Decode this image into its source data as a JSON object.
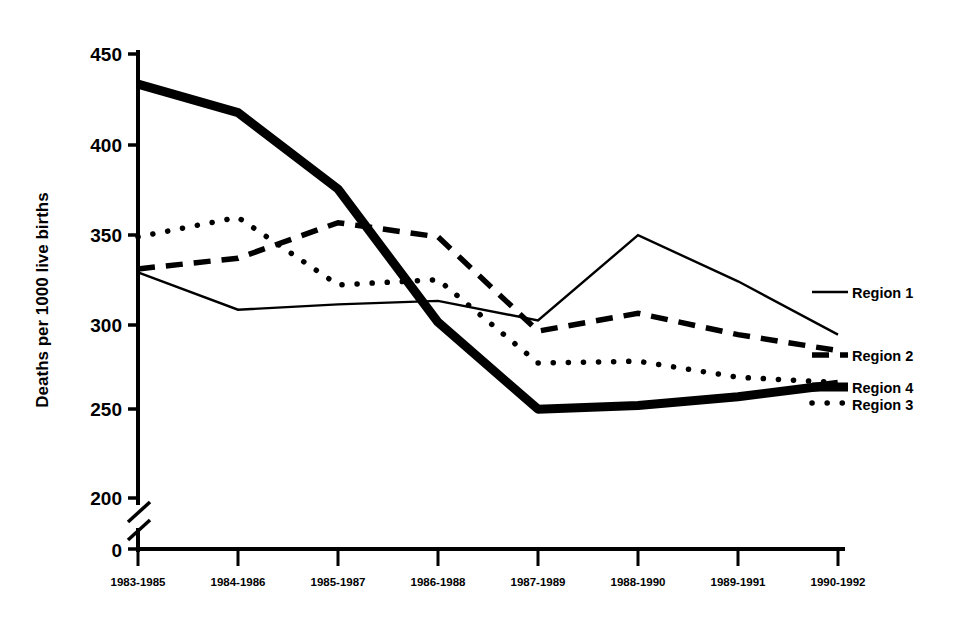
{
  "chart_data": {
    "type": "line",
    "title": "",
    "xlabel": "",
    "ylabel": "Deaths per 1000 live births",
    "categories": [
      "1983-1985",
      "1984-1986",
      "1985-1987",
      "1986-1988",
      "1987-1989",
      "1988-1990",
      "1989-1991",
      "1990-1992"
    ],
    "ytick_labels": [
      "0",
      "200",
      "250",
      "300",
      "350",
      "400",
      "450"
    ],
    "ytick_values": [
      0,
      200,
      250,
      300,
      350,
      400,
      450
    ],
    "ylim": [
      200,
      450
    ],
    "axis_break": true,
    "axis_break_between": [
      0,
      200
    ],
    "grid": false,
    "legend_position": "right",
    "series": [
      {
        "name": "Region 1",
        "style": "thin-solid",
        "values": [
          327,
          306,
          309,
          311,
          300,
          348,
          322,
          292
        ]
      },
      {
        "name": "Region 2",
        "style": "dashed",
        "values": [
          329,
          335,
          355,
          347,
          294,
          304,
          292,
          283
        ]
      },
      {
        "name": "Region 3",
        "style": "dotted",
        "values": [
          347,
          358,
          320,
          323,
          276,
          277,
          268,
          265
        ]
      },
      {
        "name": "Region 4",
        "style": "thick-solid",
        "values": [
          433,
          417,
          374,
          299,
          250,
          252,
          257,
          264
        ]
      }
    ]
  },
  "legend": {
    "entries": [
      {
        "label": "Region 1"
      },
      {
        "label": "Region 2"
      },
      {
        "label": "Region 4"
      },
      {
        "label": "Region 3"
      }
    ]
  },
  "colors": {
    "ink": "#000000",
    "background": "#ffffff"
  }
}
